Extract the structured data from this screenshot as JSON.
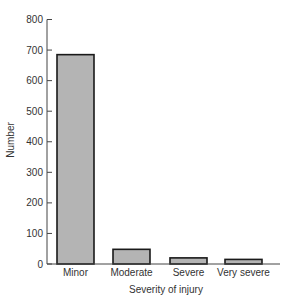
{
  "chart_data": {
    "type": "bar",
    "title": "",
    "xlabel": "Severity of injury",
    "ylabel": "Number",
    "categories": [
      "Minor",
      "Moderate",
      "Severe",
      "Very severe"
    ],
    "values": [
      685,
      48,
      20,
      15
    ],
    "ylim": [
      0,
      800
    ],
    "yticks": [
      0,
      100,
      200,
      300,
      400,
      500,
      600,
      700,
      800
    ],
    "grid": false,
    "legend": null,
    "bar_color": "#b4b4b4",
    "bar_edge_color": "#1a1a1a"
  }
}
